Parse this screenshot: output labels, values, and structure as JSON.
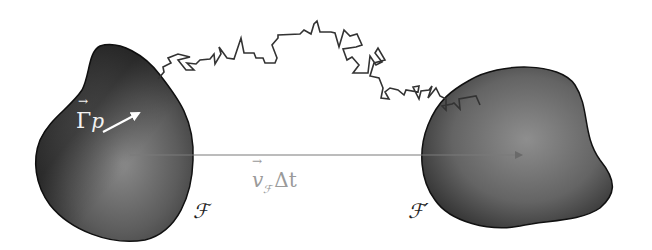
{
  "diagram": {
    "regions": [
      {
        "id": "F",
        "label": "ℱ"
      },
      {
        "id": "F_prime",
        "label": "ℱ′"
      }
    ],
    "labels": {
      "gamma_vector": "Γ",
      "gamma_subscript": "p",
      "velocity_symbol": "v",
      "velocity_subscript": "ℱ",
      "delta_t": "Δt",
      "region_left": "ℱ",
      "region_right": "ℱ′"
    },
    "colors": {
      "blob_dark": "#2a2a2a",
      "blob_mid": "#5a5a5a",
      "blob_light": "#8c8c8c",
      "outline": "#111111",
      "path_stroke": "#333333",
      "translation_arrow": "#7a7a7a",
      "gamma_arrow": "#ffffff",
      "velocity_label": "#9a9a9a"
    },
    "arrows": [
      {
        "name": "translation-arrow",
        "from": [
          130,
          155
        ],
        "to": [
          523,
          155
        ]
      },
      {
        "name": "gamma-arrow",
        "from": [
          102,
          133
        ],
        "to": [
          140,
          113
        ]
      }
    ]
  }
}
